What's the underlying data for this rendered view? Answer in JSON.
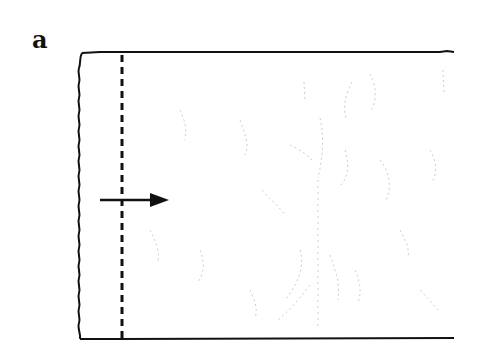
{
  "figure": {
    "panel_label": "a",
    "colors": {
      "line": "#111111",
      "texture": "#b8b8b8",
      "background": "#ffffff"
    },
    "elements": {
      "specimen": "rectangular-specimen-with-wavy-left-edge",
      "marker": "dashed-vertical-line",
      "direction": "right-pointing-arrow"
    }
  }
}
